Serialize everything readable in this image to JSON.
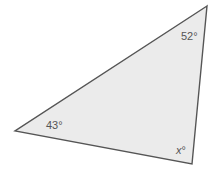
{
  "diagram": {
    "type": "triangle",
    "fill": "#ebebeb",
    "stroke": "#555555",
    "vertices": {
      "top_right": [
        207,
        6
      ],
      "left": [
        15,
        131
      ],
      "bottom_right": [
        192,
        164
      ]
    },
    "angles": {
      "top_right": "52°",
      "left": "43°",
      "bottom_right_var": "x",
      "bottom_right_deg": "°"
    }
  }
}
